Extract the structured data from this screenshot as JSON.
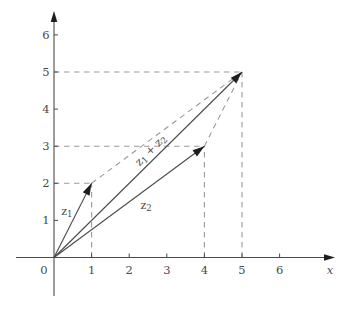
{
  "figure": {
    "colors": {
      "axis": "#4b4b4b",
      "vector": "#4b4b4b",
      "dash": "#9a9a9a",
      "arrow": "#1e1e1e",
      "text": "#4a4a4a"
    },
    "origin_label": "0",
    "x_axis_label": "x",
    "x_tick_labels": [
      "1",
      "2",
      "3",
      "4",
      "5",
      "6"
    ],
    "y_tick_labels": [
      "1",
      "2",
      "3",
      "4",
      "5",
      "6"
    ],
    "vectors": [
      {
        "name": "vector-z1",
        "from": [
          0,
          0
        ],
        "to": [
          1,
          2
        ],
        "label": {
          "segments": [
            {
              "t": "z"
            },
            {
              "t": "1",
              "sub": true
            }
          ],
          "pos": [
            0.34,
            1.25
          ],
          "rotation": 0
        }
      },
      {
        "name": "vector-z2",
        "from": [
          0,
          0
        ],
        "to": [
          4,
          3
        ],
        "label": {
          "segments": [
            {
              "t": "z"
            },
            {
              "t": "2",
              "sub": true
            }
          ],
          "pos": [
            2.45,
            1.41
          ],
          "rotation": 0
        }
      },
      {
        "name": "vector-z1-plus-z2",
        "from": [
          0,
          0
        ],
        "to": [
          5,
          5
        ],
        "label": {
          "segments": [
            {
              "t": "z"
            },
            {
              "t": "1",
              "sub": true
            },
            {
              "t": " + "
            },
            {
              "t": "z"
            },
            {
              "t": "2",
              "sub": true
            }
          ],
          "pos": [
            2.56,
            2.9
          ],
          "rotation": -45
        }
      }
    ],
    "guides": [
      {
        "name": "guide-horizontal-y5",
        "from": [
          0,
          5
        ],
        "to": [
          5,
          5
        ]
      },
      {
        "name": "guide-horizontal-y3",
        "from": [
          0,
          3
        ],
        "to": [
          4,
          3
        ]
      },
      {
        "name": "guide-horizontal-y2",
        "from": [
          0,
          2
        ],
        "to": [
          1,
          2
        ]
      },
      {
        "name": "guide-vertical-x5",
        "from": [
          5,
          0
        ],
        "to": [
          5,
          5
        ]
      },
      {
        "name": "guide-vertical-x4",
        "from": [
          4,
          0
        ],
        "to": [
          4,
          3
        ]
      },
      {
        "name": "guide-vertical-x1",
        "from": [
          1,
          0
        ],
        "to": [
          1,
          2
        ]
      },
      {
        "name": "guide-parallelogram-side-z2",
        "from": [
          1,
          2
        ],
        "to": [
          5,
          5
        ]
      },
      {
        "name": "guide-parallelogram-side-z1",
        "from": [
          4,
          3
        ],
        "to": [
          5,
          5
        ]
      }
    ]
  },
  "chart_data": {
    "type": "scatter",
    "title": "",
    "xlabel": "x",
    "ylabel": "",
    "xlim": [
      0,
      7
    ],
    "ylim": [
      0,
      7
    ],
    "x_ticks": [
      1,
      2,
      3,
      4,
      5,
      6
    ],
    "y_ticks": [
      1,
      2,
      3,
      4,
      5,
      6
    ],
    "grid": false,
    "points": [
      {
        "x": 1,
        "y": 2,
        "label": "z1"
      },
      {
        "x": 4,
        "y": 3,
        "label": "z2"
      },
      {
        "x": 5,
        "y": 5,
        "label": "z1 + z2"
      }
    ]
  }
}
